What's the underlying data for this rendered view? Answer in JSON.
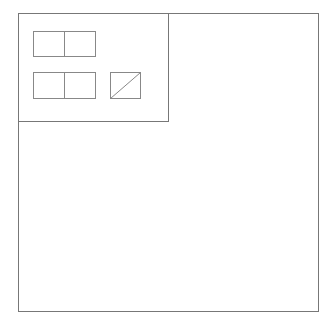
{
  "diagram": {
    "outer_frame": {
      "label": ""
    },
    "panel": {
      "label": "",
      "groups": [
        {
          "name": "top-row",
          "cells": 2
        },
        {
          "name": "bottom-row",
          "cells": 2
        }
      ],
      "placeholder": {
        "name": "diagonal-box",
        "style": "slash"
      }
    },
    "colors": {
      "stroke": "#777777",
      "background": "#ffffff"
    }
  }
}
